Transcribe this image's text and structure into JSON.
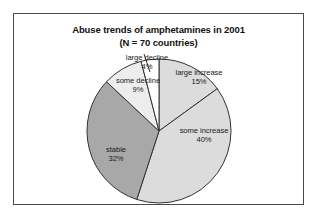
{
  "chart_data": {
    "type": "pie",
    "title": "Abuse trends of amphetamines in 2001",
    "subtitle": "(N = 70 countries)",
    "categories": [
      "large increase",
      "some increase",
      "stable",
      "some decline",
      "large decline"
    ],
    "values": [
      15,
      40,
      32,
      9,
      4
    ],
    "value_labels": [
      "15%",
      "40%",
      "32%",
      "9%",
      "4%"
    ],
    "unit": "percent",
    "start_angle_deg": 0,
    "direction": "clockwise",
    "legend": "none",
    "labels_position": "inside-and-outside",
    "colors": [
      "#dcdcdc",
      "#dcdcdc",
      "#a8a8a8",
      "#ededed",
      "#ffffff"
    ],
    "slice_outline_color": "#333333",
    "xlabel": "",
    "ylabel": ""
  },
  "frame": {
    "border_color": "#4a4a4a",
    "background": "#ffffff"
  },
  "slices": [
    {
      "name": "large increase",
      "label": "large increase",
      "pct": "15%"
    },
    {
      "name": "some increase",
      "label": "some increase",
      "pct": "40%"
    },
    {
      "name": "stable",
      "label": "stable",
      "pct": "32%"
    },
    {
      "name": "some decline",
      "label": "some decline",
      "pct": "9%"
    },
    {
      "name": "large decline",
      "label": "large decline",
      "pct": "4%"
    }
  ]
}
